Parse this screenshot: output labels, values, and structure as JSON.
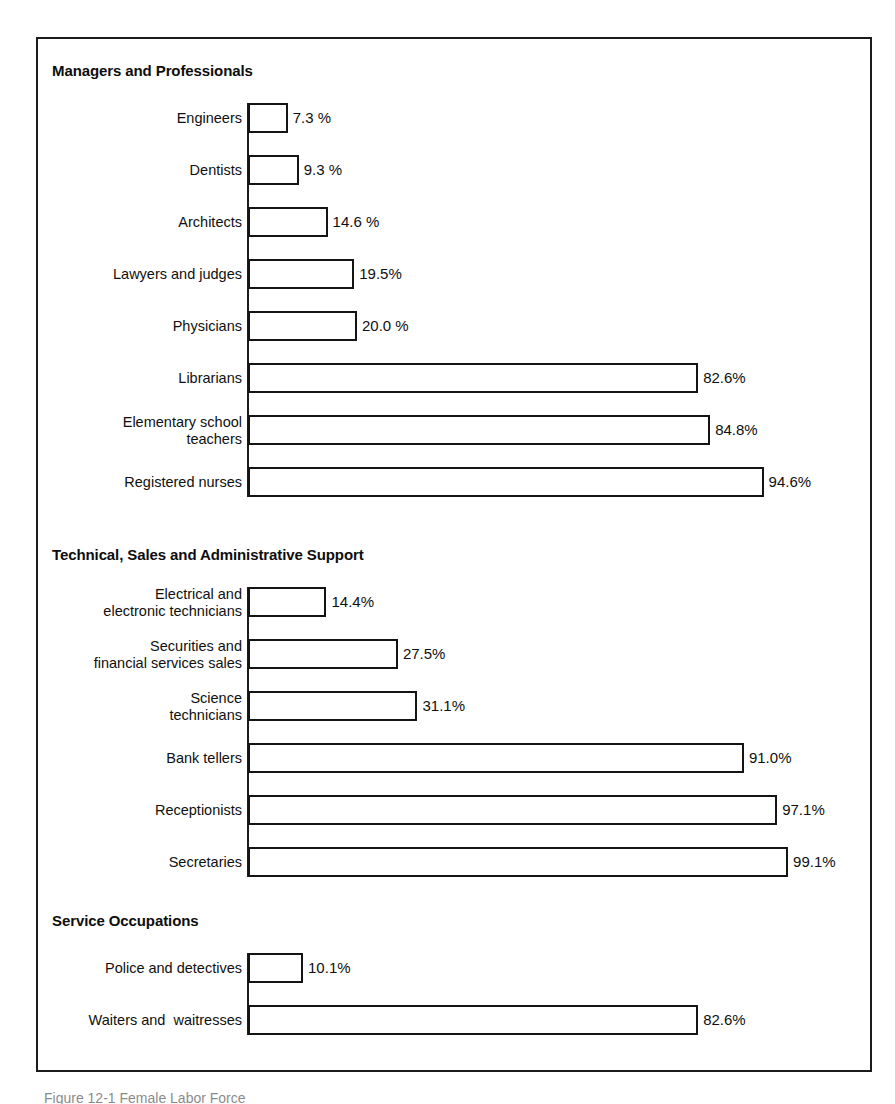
{
  "figure": {
    "caption_partial": "Figure 12-1    Female Labor Force",
    "frame_color": "#1b1b1b",
    "bar_fill": "#ffffff",
    "bar_stroke": "#141414"
  },
  "chart_data": {
    "type": "bar",
    "orientation": "horizontal",
    "title": "",
    "subtitle": "",
    "xlabel": "",
    "ylabel": "",
    "xlim": [
      0,
      100
    ],
    "grid": false,
    "legend": null,
    "value_unit": "%",
    "sections": [
      {
        "heading": "Managers and Professionals",
        "categories": [
          "Engineers",
          "Dentists",
          "Architects",
          "Lawyers and judges",
          "Physicians",
          "Librarians",
          "Elementary school\nteachers",
          "Registered nurses"
        ],
        "values": [
          7.3,
          9.3,
          14.6,
          19.5,
          20.0,
          82.6,
          84.8,
          94.6
        ],
        "labels": [
          "7.3 %",
          "9.3 %",
          "14.6 %",
          "19.5%",
          "20.0 %",
          "82.6%",
          "84.8%",
          "94.6%"
        ]
      },
      {
        "heading": "Technical, Sales and Administrative Support",
        "categories": [
          "Electrical and\nelectronic technicians",
          "Securities and\nfinancial services sales",
          "Science\ntechnicians",
          "Bank tellers",
          "Receptionists",
          "Secretaries"
        ],
        "values": [
          14.4,
          27.5,
          31.1,
          91.0,
          97.1,
          99.1
        ],
        "labels": [
          "14.4%",
          "27.5%",
          "31.1%",
          "91.0%",
          "97.1%",
          "99.1%"
        ]
      },
      {
        "heading": "Service Occupations",
        "categories": [
          "Police and detectives",
          "Waiters and  waitresses"
        ],
        "values": [
          10.1,
          82.6
        ],
        "labels": [
          "10.1%",
          "82.6%"
        ]
      }
    ]
  }
}
